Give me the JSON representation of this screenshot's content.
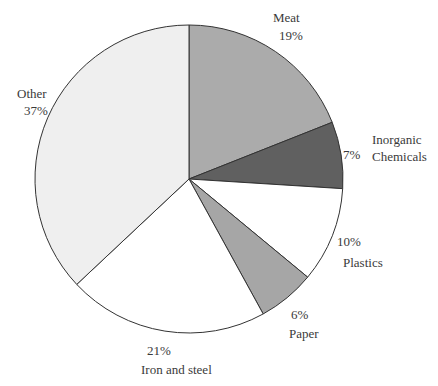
{
  "chart_data": {
    "type": "pie",
    "title": "",
    "start_angle_deg": 0,
    "direction": "clockwise",
    "center": [
      189,
      179
    ],
    "radius": 154,
    "stroke": "#333333",
    "slices": [
      {
        "label": "Meat",
        "value": 19,
        "value_label": "19%",
        "color": "#ababab"
      },
      {
        "label": "Inorganic Chemicals",
        "value": 7,
        "value_label": "7%",
        "color": "#606060"
      },
      {
        "label": "Plastics",
        "value": 10,
        "value_label": "10%",
        "color": "#ffffff"
      },
      {
        "label": "Paper",
        "value": 6,
        "value_label": "6%",
        "color": "#a6a6a6"
      },
      {
        "label": "Iron and steel",
        "value": 21,
        "value_label": "21%",
        "color": "#ffffff"
      },
      {
        "label": "Other",
        "value": 37,
        "value_label": "37%",
        "color": "#efefef"
      }
    ]
  },
  "labels": {
    "meat": {
      "name": "Meat",
      "pct": "19%"
    },
    "inorganic": {
      "name1": "Inorganic",
      "name2": "Chemicals",
      "pct": "7%"
    },
    "plastics": {
      "name": "Plastics",
      "pct": "10%"
    },
    "paper": {
      "name": "Paper",
      "pct": "6%"
    },
    "iron": {
      "name": "Iron and steel",
      "pct": "21%"
    },
    "other": {
      "name": "Other",
      "pct": "37%"
    }
  }
}
